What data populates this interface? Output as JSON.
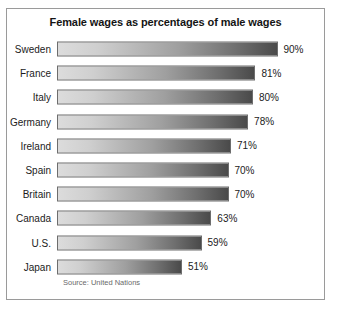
{
  "chart_data": {
    "type": "bar",
    "orientation": "horizontal",
    "title": "Female wages as percentages of male wages",
    "xlabel": "",
    "ylabel": "",
    "xlim": [
      0,
      100
    ],
    "grid": false,
    "legend": null,
    "source_note": "Source: United Nations",
    "value_suffix": "%",
    "categories": [
      "Sweden",
      "France",
      "Italy",
      "Germany",
      "Ireland",
      "Spain",
      "Britain",
      "Canada",
      "U.S.",
      "Japan"
    ],
    "values": [
      90,
      81,
      80,
      78,
      71,
      70,
      70,
      63,
      59,
      51
    ],
    "value_labels": [
      "90%",
      "81%",
      "80%",
      "78%",
      "71%",
      "70%",
      "70%",
      "63%",
      "59%",
      "51%"
    ],
    "bars": [
      {
        "category": "Sweden",
        "value": 90,
        "label": "90%"
      },
      {
        "category": "France",
        "value": 81,
        "label": "81%"
      },
      {
        "category": "Italy",
        "value": 80,
        "label": "80%"
      },
      {
        "category": "Germany",
        "value": 78,
        "label": "78%"
      },
      {
        "category": "Ireland",
        "value": 71,
        "label": "71%"
      },
      {
        "category": "Spain",
        "value": 70,
        "label": "70%"
      },
      {
        "category": "Britain",
        "value": 70,
        "label": "70%"
      },
      {
        "category": "Canada",
        "value": 63,
        "label": "63%"
      },
      {
        "category": "U.S.",
        "value": 59,
        "label": "59%"
      },
      {
        "category": "Japan",
        "value": 51,
        "label": "51%"
      }
    ],
    "colors": {
      "bar_gradient_start": "#dcdcdc",
      "bar_gradient_end": "#4a4a4a",
      "bar_border": "#6d6d6d",
      "frame_border": "#9a9a9a",
      "background": "#ffffff",
      "text": "#1b1b1b",
      "source_text": "#6a6a6a"
    }
  }
}
